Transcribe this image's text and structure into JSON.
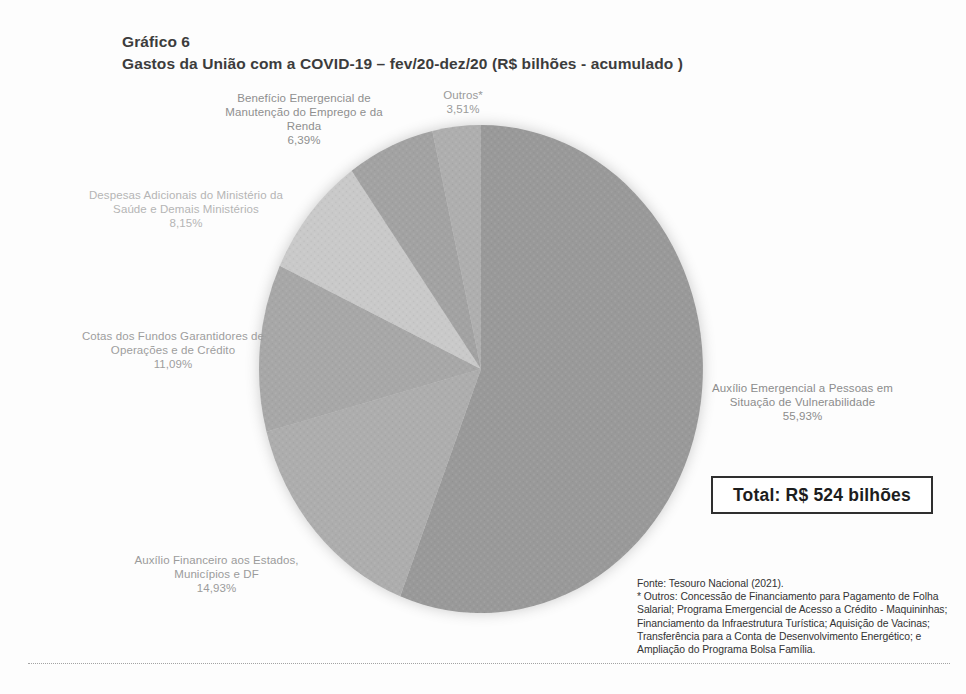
{
  "page": {
    "title_line1": "Gráfico 6",
    "title_line2": "Gastos da União com a COVID-19 – fev/20-dez/20 (R$ bilhões - acumulado )"
  },
  "chart_data": {
    "type": "pie",
    "title": "Gastos da União com a COVID-19 – fev/20-dez/20 (R$ bilhões - acumulado )",
    "unit": "%",
    "legend_position": "none",
    "grayscale_scan": true,
    "start_angle_deg_clockwise_from_top": 0,
    "total_label": "Total: R$ 524 bilhões",
    "slices": [
      {
        "name": "Auxílio Emergencial a Pessoas em Situação de Vulnerabilidade",
        "value": 55.93,
        "pct_label": "55,93%",
        "fill": "#999999",
        "label_color": "#8c8c8c"
      },
      {
        "name": "Auxílio Financeiro aos Estados, Municípios e DF",
        "value": 14.93,
        "pct_label": "14,93%",
        "fill": "#adadad",
        "label_color": "#9b9b9b"
      },
      {
        "name": "Cotas dos Fundos Garantidores de Operações e de Crédito",
        "value": 11.09,
        "pct_label": "11,09%",
        "fill": "#a7a7a7",
        "label_color": "#9d9d9d"
      },
      {
        "name": "Despesas Adicionais do Ministério da Saúde e Demais Ministérios",
        "value": 8.15,
        "pct_label": "8,15%",
        "fill": "#c9c9c9",
        "label_color": "#b5b5b5"
      },
      {
        "name": "Benefício Emergencial de Manutenção do Emprego e da Renda",
        "value": 6.39,
        "pct_label": "6,39%",
        "fill": "#a2a2a2",
        "label_color": "#8f8f8f"
      },
      {
        "name": "Outros*",
        "value": 3.51,
        "pct_label": "3,51%",
        "fill": "#aeaeae",
        "label_color": "#9a9a9a"
      }
    ]
  },
  "footnote": {
    "source": "Fonte: Tesouro Nacional (2021).",
    "outros_note": "* Outros: Concessão de Financiamento para Pagamento de Folha Salarial; Programa Emergencial de Acesso a Crédito - Maquininhas; Financiamento da Infraestrutura Turística; Aquisição de Vacinas; Transferência para a Conta de Desenvolvimento Energético; e Ampliação do Programa Bolsa Família."
  }
}
